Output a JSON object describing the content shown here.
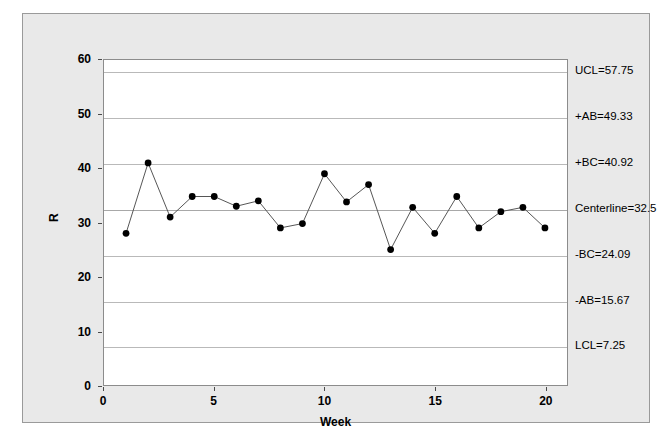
{
  "chart_data": {
    "type": "line",
    "title": "",
    "xlabel": "Week",
    "ylabel": "R",
    "x": [
      1,
      2,
      3,
      4,
      5,
      6,
      7,
      8,
      9,
      10,
      11,
      12,
      13,
      14,
      15,
      16,
      17,
      18,
      19,
      20
    ],
    "values": [
      28,
      41,
      31,
      34.8,
      34.8,
      33,
      34,
      29,
      29.8,
      39,
      33.8,
      37,
      25,
      32.8,
      28,
      34.8,
      29,
      32,
      32.8,
      29
    ],
    "series": [
      {
        "name": "R",
        "values": [
          28,
          41,
          31,
          34.8,
          34.8,
          33,
          34,
          29,
          29.8,
          39,
          33.8,
          37,
          25,
          32.8,
          28,
          34.8,
          29,
          32,
          32.8,
          29
        ]
      }
    ],
    "xlim": [
      0,
      21
    ],
    "ylim": [
      0,
      60
    ],
    "xticks": [
      0,
      5,
      10,
      15,
      20
    ],
    "yticks": [
      0,
      10,
      20,
      30,
      40,
      50,
      60
    ],
    "grid": false,
    "legend": "none",
    "marker": "filled-circle",
    "control_limits": [
      {
        "key": "UCL",
        "label": "UCL=57.75",
        "value": 57.75
      },
      {
        "key": "plus_AB",
        "label": "+AB=49.33",
        "value": 49.33
      },
      {
        "key": "plus_BC",
        "label": "+BC=40.92",
        "value": 40.92
      },
      {
        "key": "centerline",
        "label": "Centerline=32.5",
        "value": 32.5
      },
      {
        "key": "minus_BC",
        "label": "-BC=24.09",
        "value": 24.09
      },
      {
        "key": "minus_AB",
        "label": "-AB=15.67",
        "value": 15.67
      },
      {
        "key": "LCL",
        "label": "LCL=7.25",
        "value": 7.25
      }
    ],
    "colors": {
      "plot_background": "#ffffff",
      "frame_background": "#e9e9e9",
      "line": "#555555",
      "marker": "#000000",
      "limit_line": "#b9b9b9",
      "axis": "#4a4a4a"
    }
  },
  "axes": {
    "y_title": "R",
    "x_title": "Week",
    "y_tick_labels": [
      "0",
      "10",
      "20",
      "30",
      "40",
      "50",
      "60"
    ],
    "x_tick_labels": [
      "0",
      "5",
      "10",
      "15",
      "20"
    ]
  }
}
